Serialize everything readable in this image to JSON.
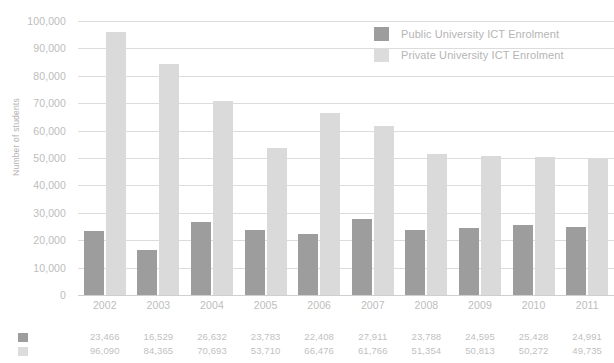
{
  "chart_data": {
    "type": "bar",
    "title": "",
    "xlabel": "",
    "ylabel": "Number of students",
    "ylim": [
      0,
      100000
    ],
    "ytick_labels": [
      "100,000",
      "90,000",
      "80,000",
      "70,000",
      "60,000",
      "50,000",
      "40,000",
      "30,000",
      "20,000",
      "10,000",
      "0"
    ],
    "ytick_values": [
      100000,
      90000,
      80000,
      70000,
      60000,
      50000,
      40000,
      30000,
      20000,
      10000,
      0
    ],
    "grid": true,
    "legend_position": "top-right-inside",
    "categories": [
      "2002",
      "2003",
      "2004",
      "2005",
      "2006",
      "2007",
      "2008",
      "2009",
      "2010",
      "2011"
    ],
    "series": [
      {
        "name": "Public University ICT Enrolment",
        "color": "#9d9d9d",
        "values": [
          23466,
          16529,
          26632,
          23783,
          22408,
          27911,
          23788,
          24595,
          25428,
          24991
        ],
        "value_labels": [
          "23,466",
          "16,529",
          "26,632",
          "23,783",
          "22,408",
          "27,911",
          "23,788",
          "24,595",
          "25,428",
          "24,991"
        ]
      },
      {
        "name": "Private University ICT Enrolment",
        "color": "#dadada",
        "values": [
          96090,
          84365,
          70693,
          53710,
          66476,
          61766,
          51354,
          50813,
          50272,
          49735
        ],
        "value_labels": [
          "96,090",
          "84,365",
          "70,693",
          "53,710",
          "66,476",
          "61,766",
          "51,354",
          "50,813",
          "50,272",
          "49,735"
        ]
      }
    ]
  },
  "legend": {
    "items": [
      {
        "label": "Public University ICT Enrolment",
        "swatch": "public-swatch"
      },
      {
        "label": "Private University ICT Enrolment",
        "swatch": "private-swatch"
      }
    ]
  }
}
